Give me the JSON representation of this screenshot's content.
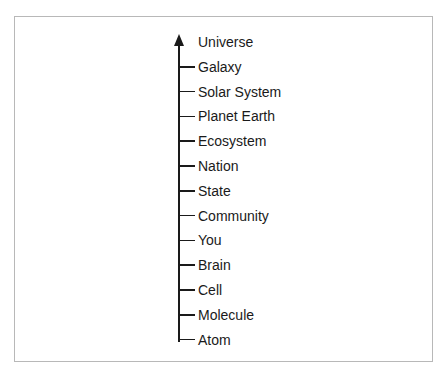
{
  "diagram": {
    "title": "",
    "direction": "up",
    "levels": [
      {
        "label": "Universe"
      },
      {
        "label": "Galaxy"
      },
      {
        "label": "Solar System"
      },
      {
        "label": "Planet Earth"
      },
      {
        "label": "Ecosystem"
      },
      {
        "label": "Nation"
      },
      {
        "label": "State"
      },
      {
        "label": "Community"
      },
      {
        "label": "You"
      },
      {
        "label": "Brain"
      },
      {
        "label": "Cell"
      },
      {
        "label": "Molecule"
      },
      {
        "label": "Atom"
      }
    ]
  }
}
